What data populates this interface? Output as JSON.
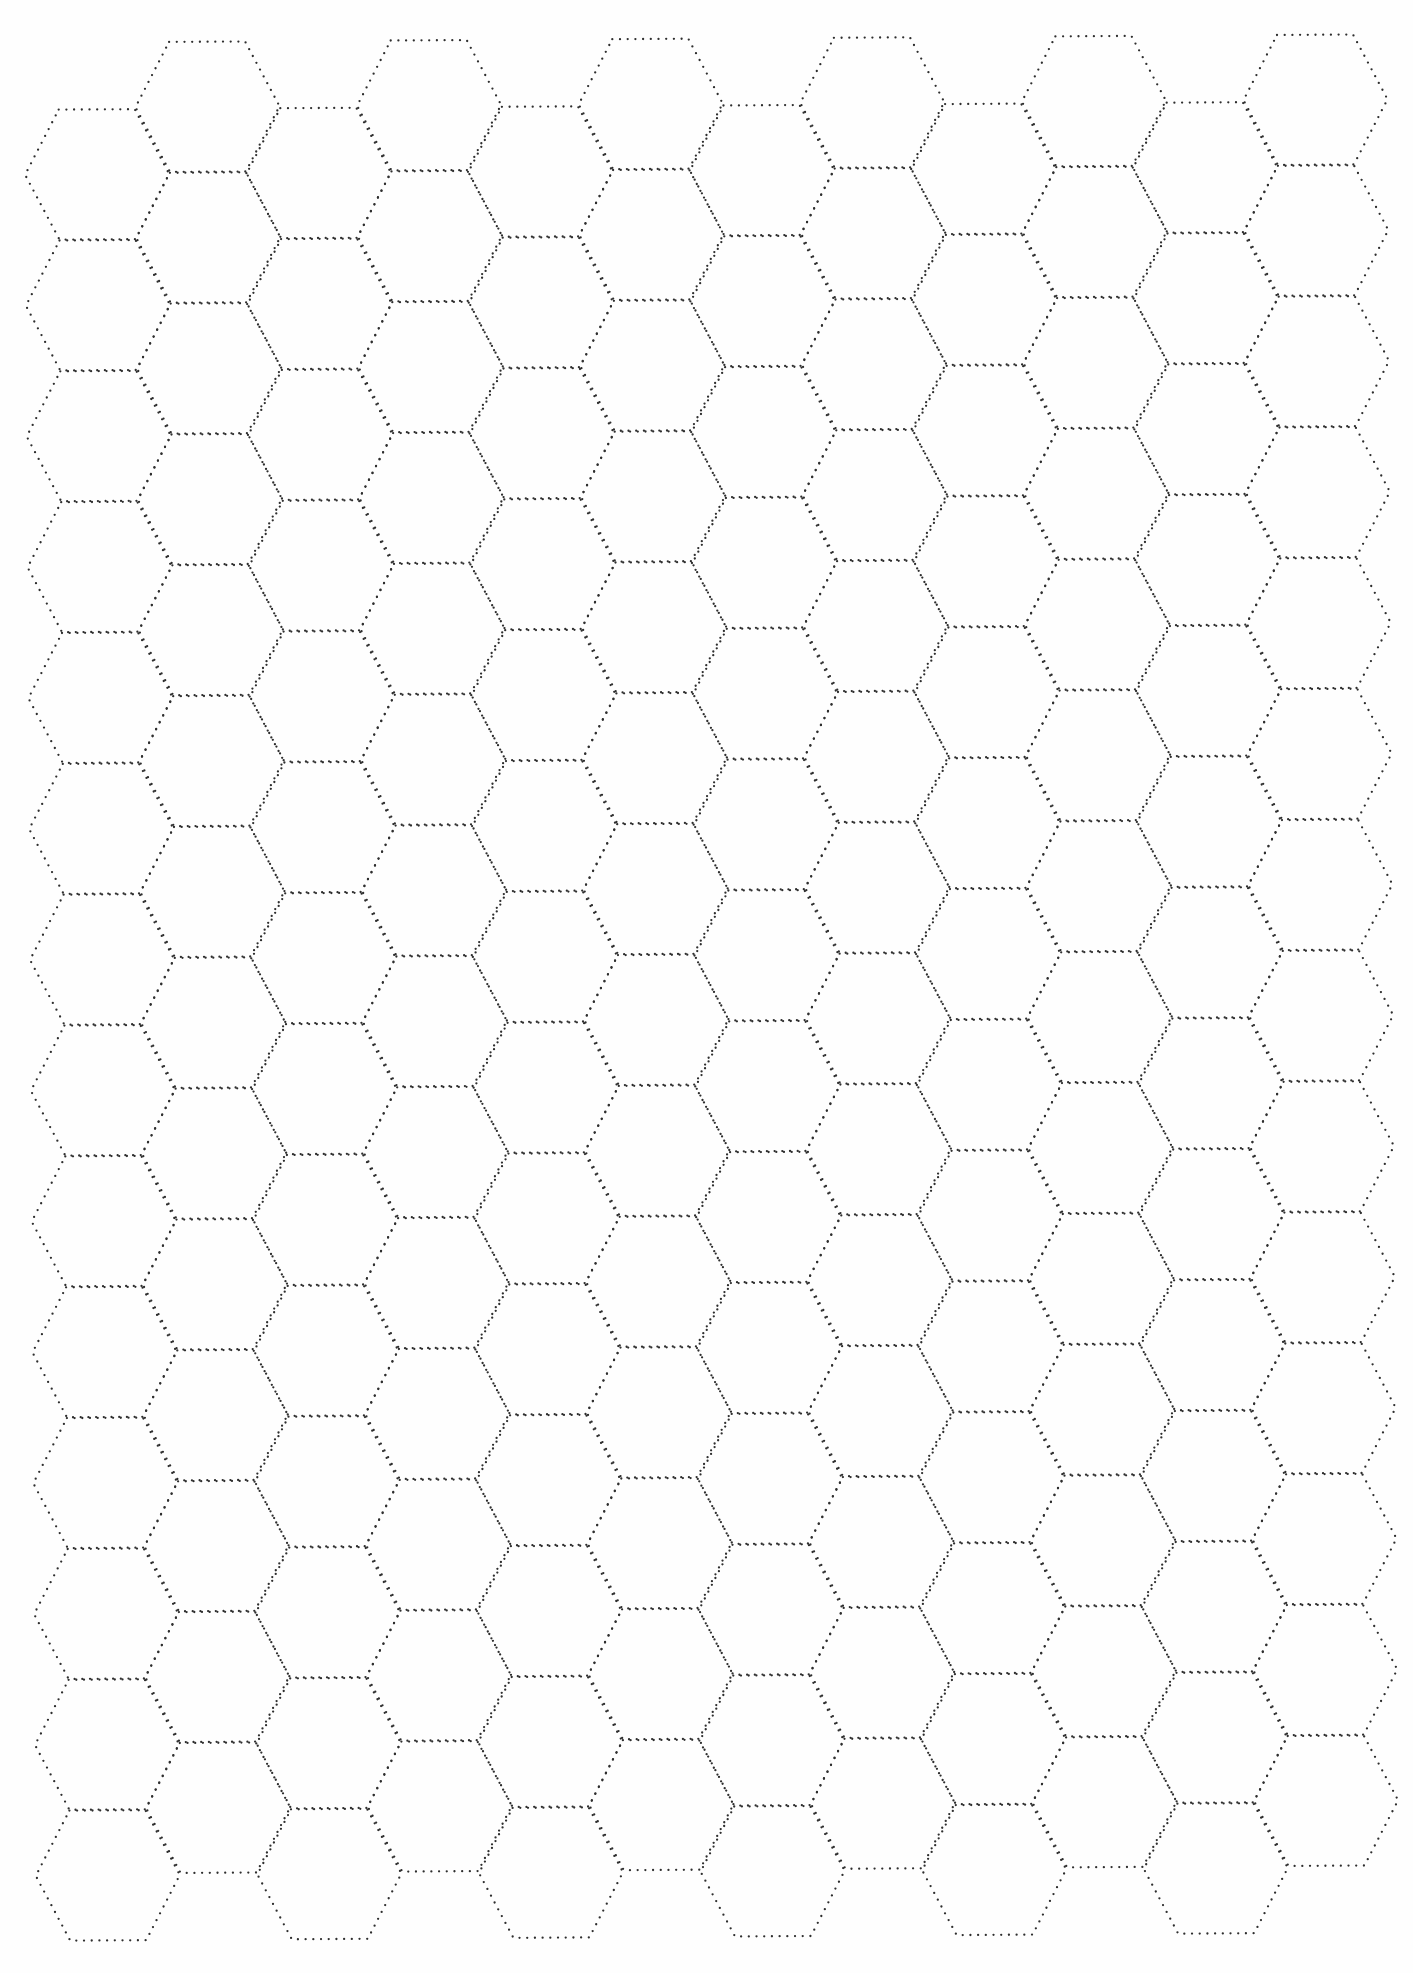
{
  "page": {
    "title": "Hexagonal grid paper",
    "background": "#fefefe"
  },
  "grid": {
    "type": "flat-top-hexagon",
    "line_style": "dotted",
    "line_color": "#2e2e2e",
    "columns": 12,
    "rows_per_column": 14,
    "column_spacing": 110.8,
    "row_spacing": 130.85,
    "hex_width": 144,
    "hex_height": 130,
    "top_edge_length": 76,
    "first_column_left_vertex_x": 24,
    "low_column_first_top_y": 110,
    "high_column_first_top_y": 43,
    "rotation_deg": -0.36
  }
}
